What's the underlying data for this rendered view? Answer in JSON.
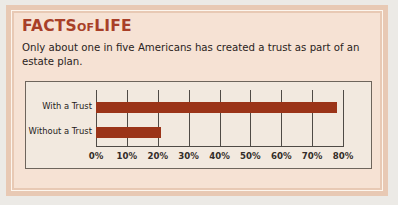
{
  "panel": {
    "headline_main1": "FACTS",
    "headline_small": "OF",
    "headline_main2": "LIFE",
    "body_text": "Only about one in five Americans has created a trust as part of an estate plan."
  },
  "colors": {
    "headline": "#a83f28",
    "bar": "#9b3418",
    "panel_bg": "#f6e2d4",
    "band": "#e8c9b4",
    "chart_bg": "#f2e9df",
    "chart_border": "#6e655c",
    "grid": "#4f4a45"
  },
  "chart_data": {
    "type": "bar",
    "orientation": "horizontal",
    "title": "",
    "subtitle": "",
    "xlabel": "",
    "ylabel": "",
    "categories": [
      "With a Trust",
      "Without a Trust"
    ],
    "values": [
      78,
      21
    ],
    "value_unit": "%",
    "xlim": [
      0,
      80
    ],
    "xticks": [
      0,
      10,
      20,
      30,
      40,
      50,
      60,
      70,
      80
    ],
    "xtick_labels": [
      "0%",
      "10%",
      "20%",
      "30%",
      "40%",
      "50%",
      "60%",
      "70%",
      "80%"
    ],
    "grid": true,
    "grid_axis": "x",
    "legend": false,
    "legend_position": "none",
    "series": [
      {
        "name": "Share of Americans",
        "color": "#9b3418",
        "values": [
          78,
          21
        ]
      }
    ]
  }
}
